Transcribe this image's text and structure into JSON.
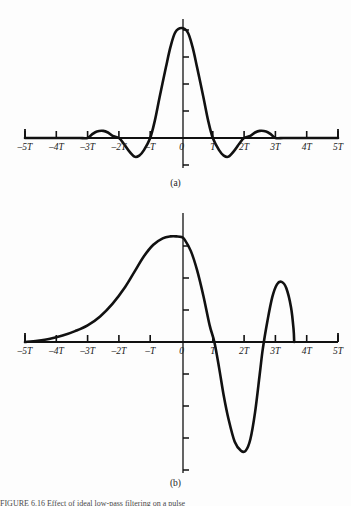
{
  "figure": {
    "background_color": "#fdfdfd",
    "stroke_color": "#111111",
    "axis_color": "#111111",
    "panel_a_caption": "(a)",
    "panel_b_caption": "(b)",
    "bottom_caption": "FIGURE 6.16   Effect of ideal low-pass filtering on a pulse"
  },
  "axis": {
    "tick_labels": [
      "–5T",
      "–4T",
      "–3T",
      "–2T",
      "–T",
      "0",
      "T",
      "2T",
      "3T",
      "4T",
      "5T"
    ],
    "tick_values": [
      -5,
      -4,
      -3,
      -2,
      -1,
      0,
      1,
      2,
      3,
      4,
      5
    ],
    "x_min": -5,
    "x_max": 5
  },
  "chart_data": [
    {
      "id": "panel-a",
      "type": "line",
      "title": "",
      "subtitle": "(a)",
      "xlabel": "",
      "ylabel": "",
      "xlim": [
        -5,
        5
      ],
      "ylim": [
        -0.25,
        1.08
      ],
      "grid": false,
      "legend": "none",
      "xtick_labels": [
        "–5T",
        "–4T",
        "–3T",
        "–2T",
        "–T",
        "0",
        "T",
        "2T",
        "3T",
        "4T",
        "5T"
      ],
      "xticks": [
        -5,
        -4,
        -3,
        -2,
        -1,
        0,
        1,
        2,
        3,
        4,
        5
      ],
      "ytick_count_above_axis": 4,
      "ytick_count_below_axis": 1,
      "description": "sinc-like impulse response: main lobe peaking at x=0 with value 1, zero crossings at x=±T and ±2T, negative side lobes between T and 2T, small positive side lobes between 2T and 3T, essentially zero beyond 3T",
      "series": [
        {
          "name": "sinc(t/T)",
          "x": [
            -5.0,
            -4.75,
            -4.5,
            -4.25,
            -4.0,
            -3.75,
            -3.5,
            -3.25,
            -3.0,
            -2.85,
            -2.7,
            -2.5,
            -2.35,
            -2.2,
            -2.0,
            -1.85,
            -1.7,
            -1.5,
            -1.35,
            -1.2,
            -1.0,
            -0.85,
            -0.7,
            -0.5,
            -0.35,
            -0.2,
            0.0,
            0.2,
            0.35,
            0.5,
            0.7,
            0.85,
            1.0,
            1.2,
            1.35,
            1.5,
            1.7,
            1.85,
            2.0,
            2.2,
            2.35,
            2.5,
            2.7,
            2.85,
            3.0,
            3.25,
            3.5,
            3.75,
            4.0,
            4.25,
            4.5,
            4.75,
            5.0
          ],
          "y": [
            0.0,
            0.0,
            0.0,
            0.0,
            0.0,
            0.0,
            0.0,
            0.0,
            0.0,
            0.035,
            0.06,
            0.065,
            0.05,
            0.02,
            0.0,
            -0.05,
            -0.11,
            -0.17,
            -0.16,
            -0.11,
            0.0,
            0.16,
            0.37,
            0.64,
            0.83,
            0.96,
            1.0,
            0.96,
            0.83,
            0.64,
            0.37,
            0.16,
            0.0,
            -0.11,
            -0.16,
            -0.17,
            -0.11,
            -0.05,
            0.0,
            0.02,
            0.05,
            0.065,
            0.06,
            0.035,
            0.0,
            0.0,
            0.0,
            0.0,
            0.0,
            0.0,
            0.0,
            0.0,
            0.0
          ]
        }
      ]
    },
    {
      "id": "panel-b",
      "type": "line",
      "title": "",
      "subtitle": "(b)",
      "xlabel": "",
      "ylabel": "",
      "xlim": [
        -5,
        5
      ],
      "ylim": [
        -1.0,
        1.0
      ],
      "grid": false,
      "legend": "none",
      "xtick_labels": [
        "–5T",
        "–4T",
        "–3T",
        "–2T",
        "–T",
        "0",
        "T",
        "2T",
        "3T",
        "4T",
        "5T"
      ],
      "xticks": [
        -5,
        -4,
        -3,
        -2,
        -1,
        0,
        1,
        2,
        3,
        4,
        5
      ],
      "ytick_count_above_axis": 3,
      "ytick_count_below_axis": 4,
      "description": "filtered pulse response: slow exponential-like rise from near zero at -5T to a peak of about 0.82 just left of 0, falling through zero shortly after T, a deep negative trough of about -0.85 near 2T, rising back through zero near 2.6T to a secondary positive peak of about 0.47 near 3.2T, then cut off abruptly at about 3.6T",
      "series": [
        {
          "name": "filtered pulse",
          "x": [
            -5.0,
            -4.6,
            -4.2,
            -3.8,
            -3.4,
            -3.0,
            -2.6,
            -2.2,
            -1.8,
            -1.5,
            -1.2,
            -0.9,
            -0.6,
            -0.35,
            -0.15,
            0.0,
            0.1,
            0.3,
            0.5,
            0.7,
            0.9,
            1.05,
            1.2,
            1.35,
            1.5,
            1.7,
            1.9,
            2.05,
            2.2,
            2.35,
            2.5,
            2.6,
            2.75,
            2.9,
            3.05,
            3.2,
            3.35,
            3.5,
            3.58,
            3.6
          ],
          "y": [
            0.0,
            0.01,
            0.025,
            0.05,
            0.085,
            0.13,
            0.2,
            0.3,
            0.43,
            0.55,
            0.67,
            0.76,
            0.81,
            0.825,
            0.825,
            0.82,
            0.8,
            0.71,
            0.56,
            0.36,
            0.13,
            0.0,
            -0.2,
            -0.42,
            -0.6,
            -0.78,
            -0.85,
            -0.85,
            -0.76,
            -0.55,
            -0.25,
            -0.05,
            0.17,
            0.35,
            0.45,
            0.47,
            0.42,
            0.27,
            0.1,
            0.0
          ]
        }
      ]
    }
  ]
}
